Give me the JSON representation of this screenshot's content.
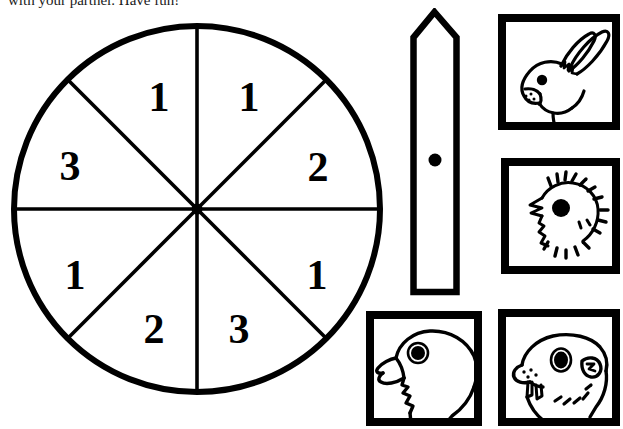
{
  "page": {
    "background_color": "#ffffff",
    "ink_color": "#000000",
    "width": 623,
    "height": 429
  },
  "instruction": {
    "text": "with your partner.  Have fun!",
    "clipped_at_top": true
  },
  "spinner": {
    "shape": "circle",
    "sector_count": 8,
    "center": {
      "x": 196,
      "y": 208
    },
    "radius": 184,
    "stroke_color": "#000000",
    "fill_color": "#ffffff",
    "sectors": [
      {
        "index": 0,
        "label": "1",
        "start_deg": -90,
        "end_deg": -45
      },
      {
        "index": 1,
        "label": "2",
        "start_deg": -45,
        "end_deg": 0
      },
      {
        "index": 2,
        "label": "1",
        "start_deg": 0,
        "end_deg": 45
      },
      {
        "index": 3,
        "label": "3",
        "start_deg": 45,
        "end_deg": 90
      },
      {
        "index": 4,
        "label": "2",
        "start_deg": 90,
        "end_deg": 135
      },
      {
        "index": 5,
        "label": "1",
        "start_deg": 135,
        "end_deg": 180
      },
      {
        "index": 6,
        "label": "3",
        "start_deg": 180,
        "end_deg": 225
      },
      {
        "index": 7,
        "label": "1",
        "start_deg": 225,
        "end_deg": 270
      }
    ],
    "digit_labels_clockwise_from_top": [
      "1",
      "2",
      "1",
      "3",
      "2",
      "1",
      "3",
      "1"
    ]
  },
  "pointer": {
    "name": "paper-clip-spinner-pointer",
    "shape": "rectangle-with-pointed-tip",
    "tip_direction": "up",
    "has_pivot_dot": true,
    "pivot_dot_color": "#000000",
    "outline_color": "#000000",
    "fill_color": "#ffffff"
  },
  "animals": [
    {
      "id": "rabbit",
      "name": "rabbit-head",
      "caption": "Rabbit",
      "frame": "thick-black-square-border",
      "style": "black-and-white-line-art"
    },
    {
      "id": "chick",
      "name": "chick-head",
      "caption": "Chick",
      "frame": "thick-black-square-border",
      "style": "black-and-white-line-art"
    },
    {
      "id": "dove",
      "name": "dove-head",
      "caption": "Dove",
      "frame": "thick-black-square-border",
      "style": "black-and-white-line-art"
    },
    {
      "id": "hamster",
      "name": "hamster-head",
      "caption": "Hamster",
      "frame": "thick-black-square-border",
      "style": "black-and-white-line-art"
    }
  ]
}
